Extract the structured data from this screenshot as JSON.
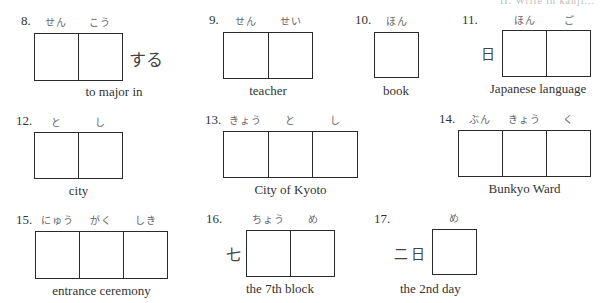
{
  "header": {
    "faded_text": "II. Write in kanji..."
  },
  "items": [
    {
      "number": "8.",
      "furigana": [
        "せん",
        "こう"
      ],
      "suffix": "する",
      "caption": "to major in",
      "cells": 2
    },
    {
      "number": "9.",
      "furigana": [
        "せん",
        "せい"
      ],
      "caption": "teacher",
      "cells": 2
    },
    {
      "number": "10.",
      "furigana": [
        "ほん"
      ],
      "caption": "book",
      "cells": 1
    },
    {
      "number": "11.",
      "furigana": [
        "ほん",
        "ご"
      ],
      "prefix": "日",
      "caption": "Japanese language",
      "cells": 2
    },
    {
      "number": "12.",
      "furigana": [
        "と",
        "し"
      ],
      "caption": "city",
      "cells": 2
    },
    {
      "number": "13.",
      "furigana": [
        "きょう",
        "と",
        "し"
      ],
      "caption": "City of Kyoto",
      "cells": 3
    },
    {
      "number": "14.",
      "furigana": [
        "ぶん",
        "きょう",
        "く"
      ],
      "caption": "Bunkyo Ward",
      "cells": 3
    },
    {
      "number": "15.",
      "furigana": [
        "にゅう",
        "がく",
        "しき"
      ],
      "caption": "entrance ceremony",
      "cells": 3
    },
    {
      "number": "16.",
      "furigana": [
        "ちょう",
        "め"
      ],
      "prefix": "七",
      "caption": "the 7th block",
      "cells": 2
    },
    {
      "number": "17.",
      "furigana": [
        "め"
      ],
      "prefix": "二日",
      "caption": "the 2nd day",
      "cells": 1
    }
  ]
}
